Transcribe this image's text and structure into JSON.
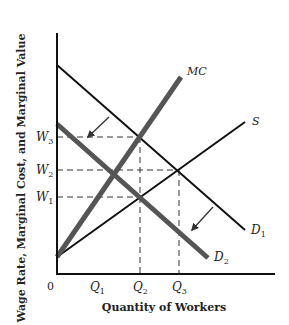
{
  "diagram": {
    "x_axis_title": "Quantity of Workers",
    "y_axis_title": "Wage Rate, Marginal Cost, and Marginal Value",
    "origin_label": "0",
    "x_ticks": [
      {
        "label": "Q",
        "sub": "1"
      },
      {
        "label": "Q",
        "sub": "2"
      },
      {
        "label": "Q",
        "sub": "3"
      }
    ],
    "y_ticks": [
      {
        "label": "W",
        "sub": "3"
      },
      {
        "label": "W",
        "sub": "2"
      },
      {
        "label": "W",
        "sub": "1"
      }
    ],
    "curves": {
      "mc": {
        "label": "MC",
        "color": "#555555"
      },
      "s": {
        "label": "S",
        "color": "#111111"
      },
      "d1": {
        "label": "D",
        "sub": "1",
        "color": "#111111"
      },
      "d2": {
        "label": "D",
        "sub": "2",
        "color": "#555555"
      }
    },
    "arrows": [
      "shift-arrow-upper",
      "shift-arrow-lower"
    ]
  }
}
